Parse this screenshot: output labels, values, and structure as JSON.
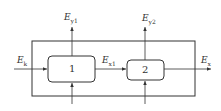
{
  "diagram": {
    "blocks": [
      {
        "id": "1",
        "label": "1"
      },
      {
        "id": "2",
        "label": "2"
      }
    ],
    "flows": {
      "input": {
        "main": "E",
        "sub": "k"
      },
      "intermediate": {
        "main": "E",
        "sub": "x1"
      },
      "output": {
        "main": "E",
        "sub": "x"
      },
      "loss1": {
        "main": "E",
        "sub": "y1"
      },
      "loss2": {
        "main": "E",
        "sub": "y2"
      }
    },
    "colors": {
      "stroke": "#333333",
      "background": "#ffffff"
    }
  }
}
